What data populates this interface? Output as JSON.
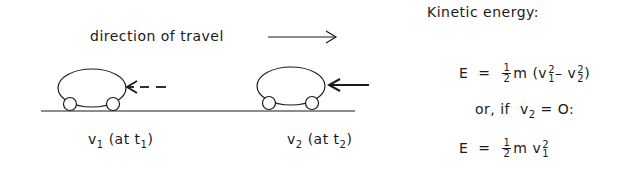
{
  "diagram": {
    "direction_label": "direction of travel",
    "car1": {
      "label_v": "v",
      "label_v_sub": "1",
      "label_at": "(at t",
      "label_t_sub": "1",
      "label_close": ")",
      "force_arrow": "dashed"
    },
    "car2": {
      "label_v": "v",
      "label_v_sub": "2",
      "label_at": "(at t",
      "label_t_sub": "2",
      "label_close": ")",
      "force_arrow": "solid"
    }
  },
  "equations": {
    "title": "Kinetic energy:",
    "eq1": {
      "lhs": "E",
      "eq": "=",
      "frac_num": "1",
      "frac_den": "2",
      "m": "m",
      "open": "(v",
      "v1_sub": "1",
      "v1_sup": "2",
      "minus": "–",
      "v2": "v",
      "v2_sub": "2",
      "v2_sup": "2",
      "close": ")"
    },
    "condition": {
      "text": "or, if",
      "v": "v",
      "v_sub": "2",
      "rest": "= O:"
    },
    "eq2": {
      "lhs": "E",
      "eq": "=",
      "frac_num": "1",
      "frac_den": "2",
      "m": "m",
      "v": "v",
      "v_sub": "1",
      "v_sup": "2"
    }
  }
}
